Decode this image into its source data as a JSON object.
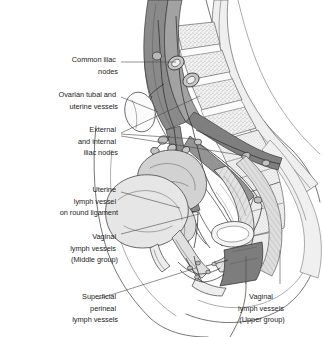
{
  "figure": {
    "background_color": "#ffffff",
    "text_color": "#1d1d1d",
    "leader_line_color": "#4a4a4a",
    "palette": {
      "vessel_dark_gray": "#8a8a8a",
      "vessel_outline": "#3c3c3c",
      "muscle_gray": "#7d7d7d",
      "organ_light_gray": "#d6d6d6",
      "bone_light": "#ececec",
      "stipple_gray": "#9a9a9a",
      "uterus_gray": "#c9c9c9",
      "white": "#ffffff"
    }
  },
  "labels": [
    {
      "id": "common-iliac-nodes",
      "lines": [
        "Common iliac",
        "nodes"
      ],
      "align": "right",
      "x": 118,
      "y": 66,
      "line_height": 11.5
    },
    {
      "id": "ovarian-tubal-uterine-vessels",
      "lines": [
        "Ovarian tubal and",
        "uterine vessels"
      ],
      "align": "right",
      "x": 118,
      "y": 101,
      "line_height": 11.5
    },
    {
      "id": "external-internal-iliac-nodes",
      "lines": [
        "External",
        "and internal",
        "iliac nodes"
      ],
      "align": "right",
      "x": 118,
      "y": 136,
      "line_height": 11.5
    },
    {
      "id": "uterine-lymph-vessel-round-ligament",
      "lines": [
        "Uterine",
        "lymph vessel",
        "on round ligament"
      ],
      "align": "right",
      "x": 118,
      "y": 196,
      "line_height": 11.5
    },
    {
      "id": "vaginal-lymph-vessels-middle",
      "lines": [
        "Vaginal",
        "lymph vessels",
        "(Middle group)"
      ],
      "align": "right",
      "x": 118,
      "y": 243,
      "line_height": 11.5
    },
    {
      "id": "superficial-perineal-lymph-vessels",
      "lines": [
        "Superficial",
        "perineal",
        "lymph vessels"
      ],
      "align": "right",
      "x": 118,
      "y": 298,
      "line_height": 11.5
    },
    {
      "id": "vaginal-lymph-vessels-upper",
      "lines": [
        "Vaginal",
        "lymph vessels",
        "(Upper group)"
      ],
      "align": "center",
      "x": 262,
      "y": 298,
      "line_height": 11.5
    }
  ],
  "structures": [
    {
      "id": "lumbar-vertebrae",
      "name": "lumbar vertebral bodies with marrow stippling"
    },
    {
      "id": "sacrum",
      "name": "sacrum and coccyx"
    },
    {
      "id": "spinal-canal",
      "name": "spinal canal"
    },
    {
      "id": "aorta-iliac-vessels",
      "name": "abdominal aorta and common iliac vessels"
    },
    {
      "id": "lymph-node-chain",
      "name": "para-aortic and iliac lymph node chain"
    },
    {
      "id": "ovary",
      "name": "ovary"
    },
    {
      "id": "uterus",
      "name": "uterus"
    },
    {
      "id": "bladder",
      "name": "urinary bladder"
    },
    {
      "id": "urethra",
      "name": "urethra"
    },
    {
      "id": "vagina",
      "name": "vagina"
    },
    {
      "id": "rectum",
      "name": "rectum and anal canal"
    },
    {
      "id": "perineal-plexus",
      "name": "superficial perineal lymphatic plexus"
    },
    {
      "id": "body-contour",
      "name": "anterior abdominal and perineal body contour"
    }
  ]
}
